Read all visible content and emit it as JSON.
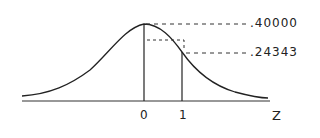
{
  "diagram": {
    "type": "normal-distribution-curve",
    "x_axis_label": "Z",
    "ticks": [
      {
        "label": "0",
        "z": 0
      },
      {
        "label": "1",
        "z": 1
      }
    ],
    "values": [
      {
        "label": ".40000",
        "z": 0,
        "meaning": "ordinate at z=0"
      },
      {
        "label": ".24343",
        "z": 1,
        "meaning": "ordinate at z=1"
      }
    ],
    "colors": {
      "line": "#222222",
      "background": "#ffffff"
    }
  }
}
